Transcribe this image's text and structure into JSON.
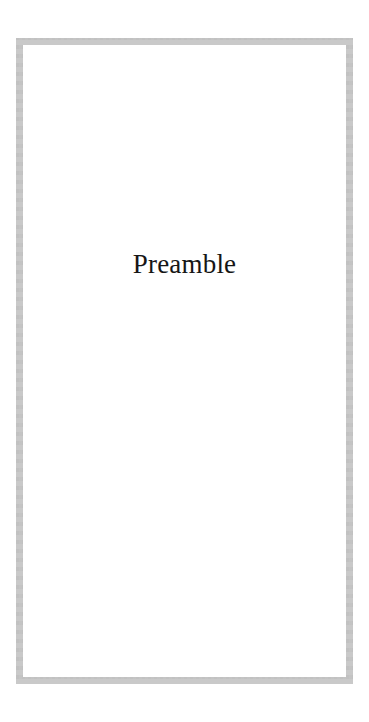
{
  "document": {
    "page_type": "part-title-page",
    "background_color": "#ffffff",
    "text_color": "#161616"
  },
  "frame": {
    "name": "decorative-border-rule",
    "color": "#c9c9c9",
    "thickness_px": 7
  },
  "content": {
    "part_title": "Preamble"
  }
}
